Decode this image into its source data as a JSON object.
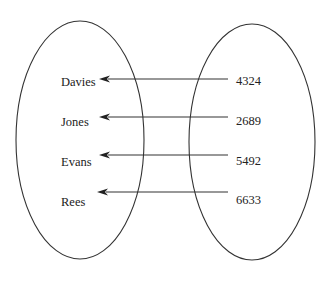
{
  "diagram": {
    "type": "mapping",
    "colors": {
      "stroke": "#333333",
      "text": "#222222",
      "background": "#ffffff"
    },
    "domain_set": {
      "ellipse": {
        "cx": 80,
        "cy": 140,
        "rx": 64,
        "ry": 119
      },
      "items": [
        {
          "label": "Davies",
          "x": 61,
          "y": 86
        },
        {
          "label": "Jones",
          "x": 61,
          "y": 126
        },
        {
          "label": "Evans",
          "x": 61,
          "y": 166
        },
        {
          "label": "Rees",
          "x": 61,
          "y": 206
        }
      ]
    },
    "codomain_set": {
      "ellipse": {
        "cx": 252,
        "cy": 142,
        "rx": 63,
        "ry": 118
      },
      "items": [
        {
          "label": "4324",
          "x": 236,
          "y": 85
        },
        {
          "label": "2689",
          "x": 236,
          "y": 125
        },
        {
          "label": "5492",
          "x": 236,
          "y": 165
        },
        {
          "label": "6633",
          "x": 236,
          "y": 204
        }
      ]
    },
    "arrows": [
      {
        "from": "4324",
        "to": "Davies",
        "x1": 228,
        "x2": 99,
        "y": 79
      },
      {
        "from": "2689",
        "to": "Jones",
        "x1": 228,
        "x2": 99,
        "y": 117
      },
      {
        "from": "5492",
        "to": "Evans",
        "x1": 228,
        "x2": 99,
        "y": 155
      },
      {
        "from": "6633",
        "to": "Rees",
        "x1": 228,
        "x2": 97,
        "y": 192
      }
    ]
  }
}
